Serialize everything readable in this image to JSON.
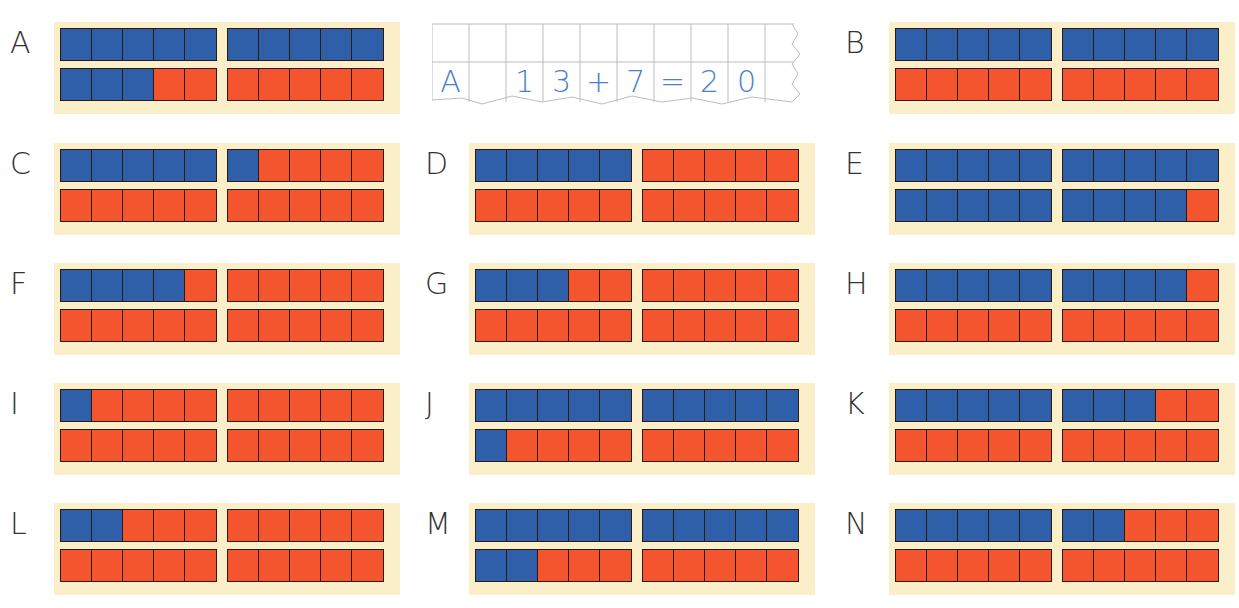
{
  "example": {
    "label": "A",
    "equation": [
      "A",
      "",
      "1",
      "3",
      "+",
      "7",
      "=",
      "2",
      "0"
    ]
  },
  "colors": {
    "blue": "#2f5fa8",
    "red": "#f4552e",
    "frame": "#fbefc9",
    "ink": "#4a7fd0"
  },
  "panels": [
    {
      "label": "A",
      "blue": 13,
      "x": 10,
      "y": 22
    },
    {
      "label": "B",
      "blue": 10,
      "x": 845,
      "y": 22
    },
    {
      "label": "C",
      "blue": 6,
      "x": 10,
      "y": 143
    },
    {
      "label": "D",
      "blue": 5,
      "x": 425,
      "y": 143
    },
    {
      "label": "E",
      "blue": 19,
      "x": 845,
      "y": 143
    },
    {
      "label": "F",
      "blue": 4,
      "x": 10,
      "y": 263
    },
    {
      "label": "G",
      "blue": 3,
      "x": 425,
      "y": 263
    },
    {
      "label": "H",
      "blue": 9,
      "x": 845,
      "y": 263
    },
    {
      "label": "I",
      "blue": 1,
      "x": 10,
      "y": 383
    },
    {
      "label": "J",
      "blue": 11,
      "x": 425,
      "y": 383
    },
    {
      "label": "K",
      "blue": 8,
      "x": 845,
      "y": 383
    },
    {
      "label": "L",
      "blue": 2,
      "x": 10,
      "y": 503
    },
    {
      "label": "M",
      "blue": 12,
      "x": 425,
      "y": 503
    },
    {
      "label": "N",
      "blue": 7,
      "x": 845,
      "y": 503
    }
  ],
  "chart_data": {
    "type": "table",
    "categories": [
      "A",
      "B",
      "C",
      "D",
      "E",
      "F",
      "G",
      "H",
      "I",
      "J",
      "K",
      "L",
      "M",
      "N"
    ],
    "values": [
      13,
      10,
      6,
      5,
      19,
      4,
      3,
      9,
      1,
      11,
      8,
      2,
      12,
      7
    ],
    "total_per_panel": 20,
    "example_equation": "A 13 + 7 = 20"
  }
}
